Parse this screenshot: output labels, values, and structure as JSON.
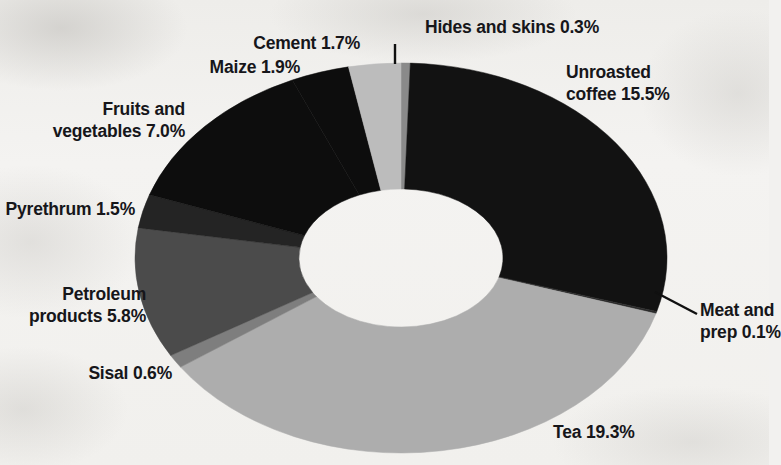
{
  "chart_data": {
    "type": "pie",
    "variant": "donut",
    "title": "",
    "subtitle": "",
    "xlabel": "",
    "ylabel": "",
    "legend": "none (direct callout labels)",
    "grid": false,
    "value_unit": "percent",
    "value_suffix": "%",
    "categories": [
      "Hides and skins",
      "Unroasted coffee",
      "Meat and prep",
      "Tea",
      "Sisal",
      "Petroleum products",
      "Pyrethrum",
      "Fruits and vegetables",
      "Maize",
      "Cement"
    ],
    "values": [
      0.3,
      15.5,
      0.1,
      19.3,
      0.6,
      5.8,
      1.5,
      7.0,
      1.9,
      1.7
    ],
    "slices": [
      {
        "name": "Hides and skins",
        "value": 0.3,
        "label": "Hides and skins 0.3%",
        "color": "#8a8a8a"
      },
      {
        "name": "Unroasted coffee",
        "value": 15.5,
        "label": "Unroasted coffee 15.5%",
        "color": "#121212"
      },
      {
        "name": "Meat and prep",
        "value": 0.1,
        "label": "Meat and prep 0.1%",
        "color": "#2b2b2b"
      },
      {
        "name": "Tea",
        "value": 19.3,
        "label": "Tea 19.3%",
        "color": "#adadad"
      },
      {
        "name": "Sisal",
        "value": 0.6,
        "label": "Sisal 0.6%",
        "color": "#7e7e7e"
      },
      {
        "name": "Petroleum products",
        "value": 5.8,
        "label": "Petroleum products 5.8%",
        "color": "#4b4b4b"
      },
      {
        "name": "Pyrethrum",
        "value": 1.5,
        "label": "Pyrethrum 1.5%",
        "color": "#242424"
      },
      {
        "name": "Fruits and vegetables",
        "value": 7.0,
        "label": "Fruits and vegetables 7.0%",
        "color": "#0d0d0d"
      },
      {
        "name": "Maize",
        "value": 1.9,
        "label": "Maize 1.9%",
        "color": "#0d0d0d"
      },
      {
        "name": "Cement",
        "value": 1.7,
        "label": "Cement 1.7%",
        "color": "#bcbcbc"
      }
    ],
    "total_shown": 53.7,
    "start_angle_deg": 0,
    "direction": "clockwise"
  },
  "callouts": {
    "hides_and_skins": {
      "line1": "Hides and skins 0.3%"
    },
    "cement": {
      "line1": "Cement 1.7%"
    },
    "maize": {
      "line1": "Maize 1.9%"
    },
    "fruits_and_vegetables": {
      "line1": "Fruits and",
      "line2": "vegetables 7.0%"
    },
    "pyrethrum": {
      "line1": "Pyrethrum 1.5%"
    },
    "petroleum_products": {
      "line1": "Petroleum",
      "line2": "products 5.8%"
    },
    "sisal": {
      "line1": "Sisal 0.6%"
    },
    "tea": {
      "line1": "Tea 19.3%"
    },
    "meat_and_prep": {
      "line1": "Meat and",
      "line2": "prep 0.1%"
    },
    "unroasted_coffee": {
      "line1": "Unroasted",
      "line2": "coffee 15.5%"
    }
  },
  "colors": {
    "background": "#f2f1ef",
    "text": "#16161a",
    "leader_line": "#101010"
  }
}
